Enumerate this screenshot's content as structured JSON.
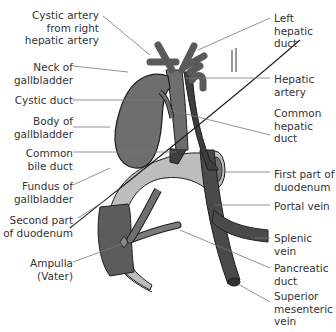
{
  "colors": {
    "dark_structure": "#4a4a4a",
    "gallbladder": "#6e6e6e",
    "duodenum": "#bdbdbd",
    "duodenum_inner": "#5c5c5c",
    "outline": "#1e1e1e",
    "leader_line": "#777777",
    "label_text": "#333333"
  },
  "labels": {
    "left": [
      {
        "id": "cystic-artery",
        "text": "Cystic artery\nfrom right\nhepatic artery"
      },
      {
        "id": "neck-gallbladder",
        "text": "Neck of\ngallbladder"
      },
      {
        "id": "cystic-duct",
        "text": "Cystic duct"
      },
      {
        "id": "body-gallbladder",
        "text": "Body of\ngallbladder"
      },
      {
        "id": "common-bile-duct",
        "text": "Common\nbile duct"
      },
      {
        "id": "fundus-gallbladder",
        "text": "Fundus of\ngallbladder"
      },
      {
        "id": "second-part-duodenum",
        "text": "Second part\nof duodenum"
      },
      {
        "id": "ampulla",
        "text": "Ampulla\n(Vater)"
      }
    ],
    "right": [
      {
        "id": "left-hepatic-duct",
        "text": "Left hepatic\nduct"
      },
      {
        "id": "hepatic-artery",
        "text": "Hepatic\nartery"
      },
      {
        "id": "common-hepatic-duct",
        "text": "Common\nhepatic duct"
      },
      {
        "id": "first-part-duodenum",
        "text": "First part of\nduodenum"
      },
      {
        "id": "portal-vein",
        "text": "Portal vein"
      },
      {
        "id": "splenic-vein",
        "text": "Splenic vein"
      },
      {
        "id": "pancreatic-duct",
        "text": "Pancreatic\nduct"
      },
      {
        "id": "superior-mesenteric-vein",
        "text": "Superior\nmesenteric\nvein"
      }
    ]
  }
}
